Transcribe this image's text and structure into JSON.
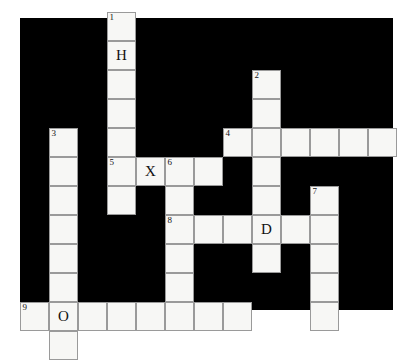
{
  "puzzle": {
    "title": "crossword-grid",
    "columns": 13,
    "rows": 10,
    "cell_size": 29,
    "board_left": 20,
    "board_top": 18,
    "board_width": 373,
    "board_height": 292,
    "colors": {
      "board_background": "#000000",
      "cell_fill": "#f7f7f5",
      "cell_border": "#9a9a9a",
      "text": "#111111",
      "page_background": "#ffffff"
    },
    "cells": [
      {
        "name": "cell-r0c3",
        "col": 3,
        "row": 0,
        "number": "1",
        "letter": ""
      },
      {
        "name": "cell-r1c3",
        "col": 3,
        "row": 1,
        "number": "",
        "letter": "H"
      },
      {
        "name": "cell-r2c3",
        "col": 3,
        "row": 2,
        "number": "",
        "letter": ""
      },
      {
        "name": "cell-r2c8",
        "col": 8,
        "row": 2,
        "number": "2",
        "letter": ""
      },
      {
        "name": "cell-r3c3",
        "col": 3,
        "row": 3,
        "number": "",
        "letter": ""
      },
      {
        "name": "cell-r3c8",
        "col": 8,
        "row": 3,
        "number": "",
        "letter": ""
      },
      {
        "name": "cell-r4c1",
        "col": 1,
        "row": 4,
        "number": "3",
        "letter": ""
      },
      {
        "name": "cell-r4c3",
        "col": 3,
        "row": 4,
        "number": "",
        "letter": ""
      },
      {
        "name": "cell-r4c7",
        "col": 7,
        "row": 4,
        "number": "4",
        "letter": ""
      },
      {
        "name": "cell-r4c8",
        "col": 8,
        "row": 4,
        "number": "",
        "letter": ""
      },
      {
        "name": "cell-r4c9",
        "col": 9,
        "row": 4,
        "number": "",
        "letter": ""
      },
      {
        "name": "cell-r4c10",
        "col": 10,
        "row": 4,
        "number": "",
        "letter": ""
      },
      {
        "name": "cell-r4c11",
        "col": 11,
        "row": 4,
        "number": "",
        "letter": ""
      },
      {
        "name": "cell-r4c12",
        "col": 12,
        "row": 4,
        "number": "",
        "letter": ""
      },
      {
        "name": "cell-r5c1",
        "col": 1,
        "row": 5,
        "number": "",
        "letter": ""
      },
      {
        "name": "cell-r5c3",
        "col": 3,
        "row": 5,
        "number": "5",
        "letter": ""
      },
      {
        "name": "cell-r5c4",
        "col": 4,
        "row": 5,
        "number": "",
        "letter": "X"
      },
      {
        "name": "cell-r5c5",
        "col": 5,
        "row": 5,
        "number": "6",
        "letter": ""
      },
      {
        "name": "cell-r5c6",
        "col": 6,
        "row": 5,
        "number": "",
        "letter": ""
      },
      {
        "name": "cell-r5c8",
        "col": 8,
        "row": 5,
        "number": "",
        "letter": ""
      },
      {
        "name": "cell-r6c1",
        "col": 1,
        "row": 6,
        "number": "",
        "letter": ""
      },
      {
        "name": "cell-r6c3",
        "col": 3,
        "row": 6,
        "number": "",
        "letter": ""
      },
      {
        "name": "cell-r6c5",
        "col": 5,
        "row": 6,
        "number": "",
        "letter": ""
      },
      {
        "name": "cell-r6c8",
        "col": 8,
        "row": 6,
        "number": "",
        "letter": ""
      },
      {
        "name": "cell-r6c10",
        "col": 10,
        "row": 6,
        "number": "7",
        "letter": ""
      },
      {
        "name": "cell-r7c1",
        "col": 1,
        "row": 7,
        "number": "",
        "letter": ""
      },
      {
        "name": "cell-r7c5",
        "col": 5,
        "row": 7,
        "number": "8",
        "letter": ""
      },
      {
        "name": "cell-r7c6",
        "col": 6,
        "row": 7,
        "number": "",
        "letter": ""
      },
      {
        "name": "cell-r7c7",
        "col": 7,
        "row": 7,
        "number": "",
        "letter": ""
      },
      {
        "name": "cell-r7c8",
        "col": 8,
        "row": 7,
        "number": "",
        "letter": "D"
      },
      {
        "name": "cell-r7c9",
        "col": 9,
        "row": 7,
        "number": "",
        "letter": ""
      },
      {
        "name": "cell-r7c10",
        "col": 10,
        "row": 7,
        "number": "",
        "letter": ""
      },
      {
        "name": "cell-r8c1",
        "col": 1,
        "row": 8,
        "number": "",
        "letter": ""
      },
      {
        "name": "cell-r8c5",
        "col": 5,
        "row": 8,
        "number": "",
        "letter": ""
      },
      {
        "name": "cell-r8c8",
        "col": 8,
        "row": 8,
        "number": "",
        "letter": ""
      },
      {
        "name": "cell-r8c10",
        "col": 10,
        "row": 8,
        "number": "",
        "letter": ""
      },
      {
        "name": "cell-r9c1",
        "col": 1,
        "row": 9,
        "number": "",
        "letter": ""
      },
      {
        "name": "cell-r9c5",
        "col": 5,
        "row": 9,
        "number": "",
        "letter": ""
      },
      {
        "name": "cell-r9c10",
        "col": 10,
        "row": 9,
        "number": "",
        "letter": ""
      },
      {
        "name": "cell-r10c0",
        "col": 0,
        "row": 10,
        "number": "9",
        "letter": ""
      },
      {
        "name": "cell-r10c1",
        "col": 1,
        "row": 10,
        "number": "",
        "letter": "O"
      },
      {
        "name": "cell-r10c2",
        "col": 2,
        "row": 10,
        "number": "",
        "letter": ""
      },
      {
        "name": "cell-r10c3",
        "col": 3,
        "row": 10,
        "number": "",
        "letter": ""
      },
      {
        "name": "cell-r10c4",
        "col": 4,
        "row": 10,
        "number": "",
        "letter": ""
      },
      {
        "name": "cell-r10c5",
        "col": 5,
        "row": 10,
        "number": "",
        "letter": ""
      },
      {
        "name": "cell-r10c6",
        "col": 6,
        "row": 10,
        "number": "",
        "letter": ""
      },
      {
        "name": "cell-r10c7",
        "col": 7,
        "row": 10,
        "number": "",
        "letter": ""
      },
      {
        "name": "cell-r10c10",
        "col": 10,
        "row": 10,
        "number": "",
        "letter": ""
      },
      {
        "name": "cell-r11c1",
        "col": 1,
        "row": 11,
        "number": "",
        "letter": ""
      }
    ]
  }
}
